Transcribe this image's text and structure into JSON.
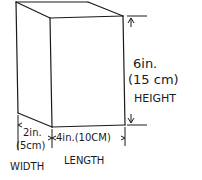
{
  "diagram": {
    "type": "rectangular-prism-dimensions",
    "height": {
      "imperial": "6in.",
      "metric": "(15 cm)",
      "label": "HEIGHT"
    },
    "width": {
      "imperial": "2in.",
      "metric": "(5cm)",
      "label": "WIDTH"
    },
    "length": {
      "combined": "4in.(10CM)",
      "label": "LENGTH"
    },
    "colors": {
      "stroke": "#1a1a1a",
      "background": "#ffffff"
    }
  }
}
